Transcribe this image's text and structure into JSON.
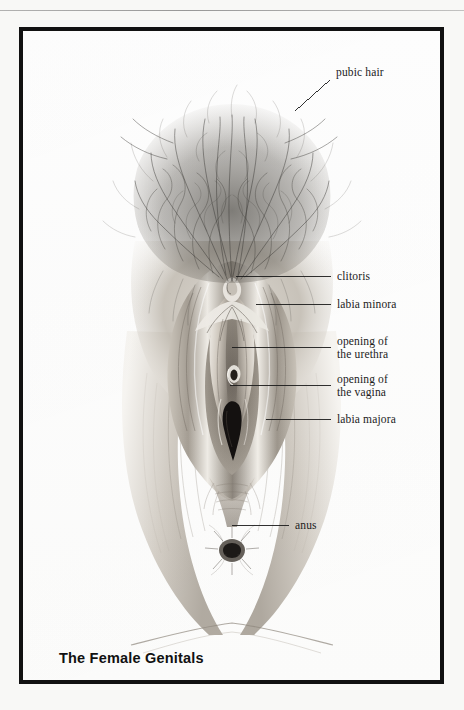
{
  "page": {
    "background_color": "#f8f8f6",
    "rule_color": "#787878",
    "header_ghost": ""
  },
  "figure": {
    "frame_color": "#111111",
    "caption": "The Female Genitals",
    "illustration": {
      "name": "female-external-genitalia-drawing",
      "medium": "graphite pencil drawing, grayscale",
      "ink_color": "#2a2a2a",
      "skin_light": "#e8e4de",
      "skin_mid": "#b9b3aa",
      "skin_dark": "#8a837a",
      "shadow_color": "#4a4640",
      "hair_color": "#3c3a36"
    },
    "labels": [
      {
        "id": "pubic-hair",
        "text": "pubic hair",
        "text_x": 332,
        "text_y": 62,
        "leader": {
          "x1": 291,
          "y1": 99,
          "x2": 326,
          "y2": 68
        },
        "align": "left"
      },
      {
        "id": "clitoris",
        "text": "clitoris",
        "text_x": 333,
        "text_y": 266,
        "leader": {
          "x1": 232,
          "y1": 272,
          "x2": 327,
          "y2": 272
        },
        "align": "left"
      },
      {
        "id": "labia-minora",
        "text": "labia minora",
        "text_x": 333,
        "text_y": 294,
        "leader": {
          "x1": 252,
          "y1": 300,
          "x2": 327,
          "y2": 300
        },
        "align": "left"
      },
      {
        "id": "opening-of-the-urethra",
        "text": "opening of\nthe urethra",
        "text_x": 333,
        "text_y": 331,
        "leader": {
          "x1": 228,
          "y1": 343,
          "x2": 327,
          "y2": 343
        },
        "align": "left"
      },
      {
        "id": "opening-of-the-vagina",
        "text": "opening of\nthe vagina",
        "text_x": 333,
        "text_y": 369,
        "leader": {
          "x1": 226,
          "y1": 381,
          "x2": 327,
          "y2": 381
        },
        "align": "left"
      },
      {
        "id": "labia-majora",
        "text": "labia majora",
        "text_x": 333,
        "text_y": 409,
        "leader": {
          "x1": 262,
          "y1": 415,
          "x2": 327,
          "y2": 415
        },
        "align": "left"
      },
      {
        "id": "anus",
        "text": "anus",
        "text_x": 291,
        "text_y": 515,
        "leader": {
          "x1": 228,
          "y1": 521,
          "x2": 285,
          "y2": 521
        },
        "align": "left"
      }
    ]
  }
}
